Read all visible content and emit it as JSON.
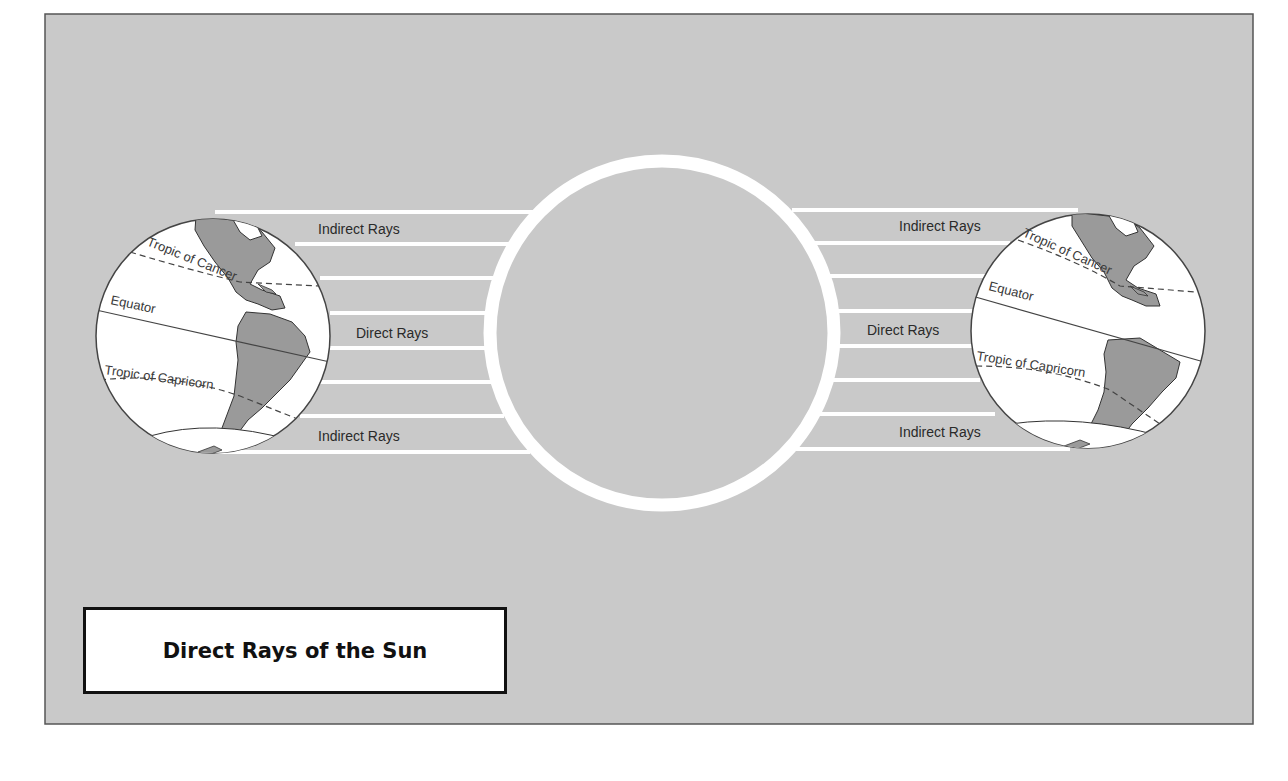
{
  "diagram": {
    "title": "Direct Rays of the Sun",
    "colors": {
      "panel_background": "#c9c9c9",
      "panel_border": "#555555",
      "rays": "#ffffff",
      "sun_outline": "#ffffff",
      "ocean": "#ffffff",
      "land": "#9a9a9a",
      "lines": "#444444"
    },
    "sun": {
      "label": ""
    },
    "ray_labels": {
      "left_top": "Indirect Rays",
      "left_middle": "Direct Rays",
      "left_bottom": "Indirect Rays",
      "right_top": "Indirect Rays",
      "right_middle": "Direct Rays",
      "right_bottom": "Indirect Rays"
    },
    "globe_left": {
      "tropic_cancer": "Tropic of Cancer",
      "equator": "Equator",
      "tropic_capricorn": "Tropic of Capricorn"
    },
    "globe_right": {
      "tropic_cancer": "Tropic of Cancer",
      "equator": "Equator",
      "tropic_capricorn": "Tropic of Capricorn"
    }
  }
}
